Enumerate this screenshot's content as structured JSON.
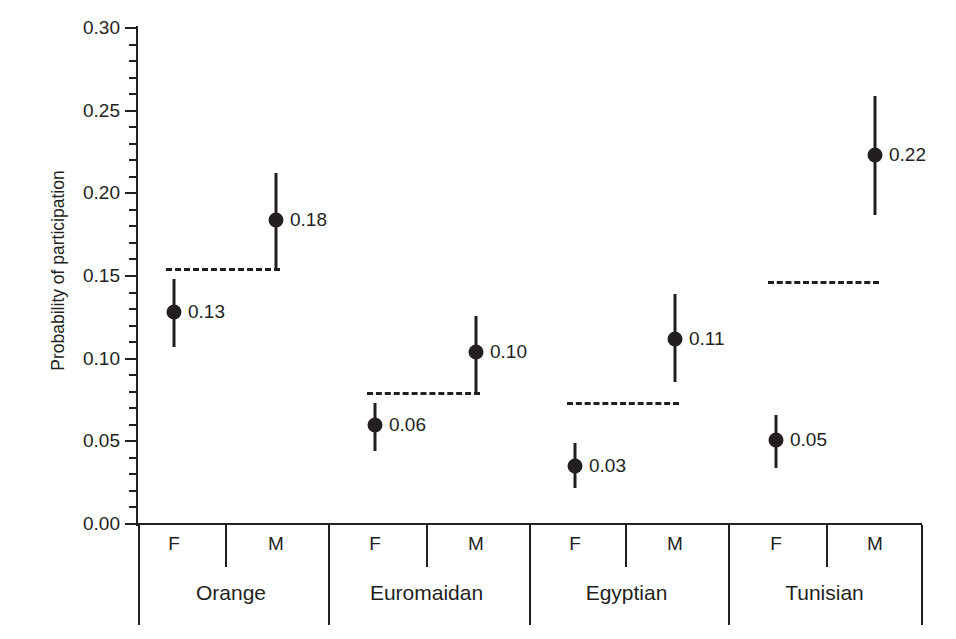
{
  "chart_data": {
    "type": "scatter",
    "title": "",
    "xlabel": "",
    "ylabel": "Probability of participation",
    "ylim": [
      0.0,
      0.3
    ],
    "ytick_labels": [
      "0.00",
      "0.05",
      "0.10",
      "0.15",
      "0.20",
      "0.25",
      "0.30"
    ],
    "ytick_values": [
      0.0,
      0.05,
      0.1,
      0.15,
      0.2,
      0.25,
      0.3
    ],
    "minor_tick_step": 0.01,
    "grid": false,
    "legend": "none",
    "groups": [
      "Orange",
      "Euromaidan",
      "Egyptian",
      "Tunisian"
    ],
    "sub_categories": [
      "F",
      "M"
    ],
    "points": [
      {
        "group": "Orange",
        "sex": "F",
        "label": "0.13",
        "value": 0.128,
        "ci_low": 0.107,
        "ci_high": 0.148
      },
      {
        "group": "Orange",
        "sex": "M",
        "label": "0.18",
        "value": 0.184,
        "ci_low": 0.154,
        "ci_high": 0.212
      },
      {
        "group": "Euromaidan",
        "sex": "F",
        "label": "0.06",
        "value": 0.06,
        "ci_low": 0.044,
        "ci_high": 0.073
      },
      {
        "group": "Euromaidan",
        "sex": "M",
        "label": "0.10",
        "value": 0.104,
        "ci_low": 0.08,
        "ci_high": 0.126
      },
      {
        "group": "Egyptian",
        "sex": "F",
        "label": "0.03",
        "value": 0.035,
        "ci_low": 0.022,
        "ci_high": 0.049
      },
      {
        "group": "Egyptian",
        "sex": "M",
        "label": "0.11",
        "value": 0.112,
        "ci_low": 0.086,
        "ci_high": 0.139
      },
      {
        "group": "Tunisian",
        "sex": "F",
        "label": "0.05",
        "value": 0.051,
        "ci_low": 0.034,
        "ci_high": 0.066
      },
      {
        "group": "Tunisian",
        "sex": "M",
        "label": "0.22",
        "value": 0.223,
        "ci_low": 0.187,
        "ci_high": 0.259
      }
    ],
    "reference_lines": [
      {
        "group": "Orange",
        "value": 0.155
      },
      {
        "group": "Euromaidan",
        "value": 0.08
      },
      {
        "group": "Egyptian",
        "value": 0.074
      },
      {
        "group": "Tunisian",
        "value": 0.147
      }
    ]
  },
  "axis": {
    "y_title": "Probability of participation"
  },
  "colors": {
    "ink": "#231f20",
    "background": "#ffffff"
  }
}
